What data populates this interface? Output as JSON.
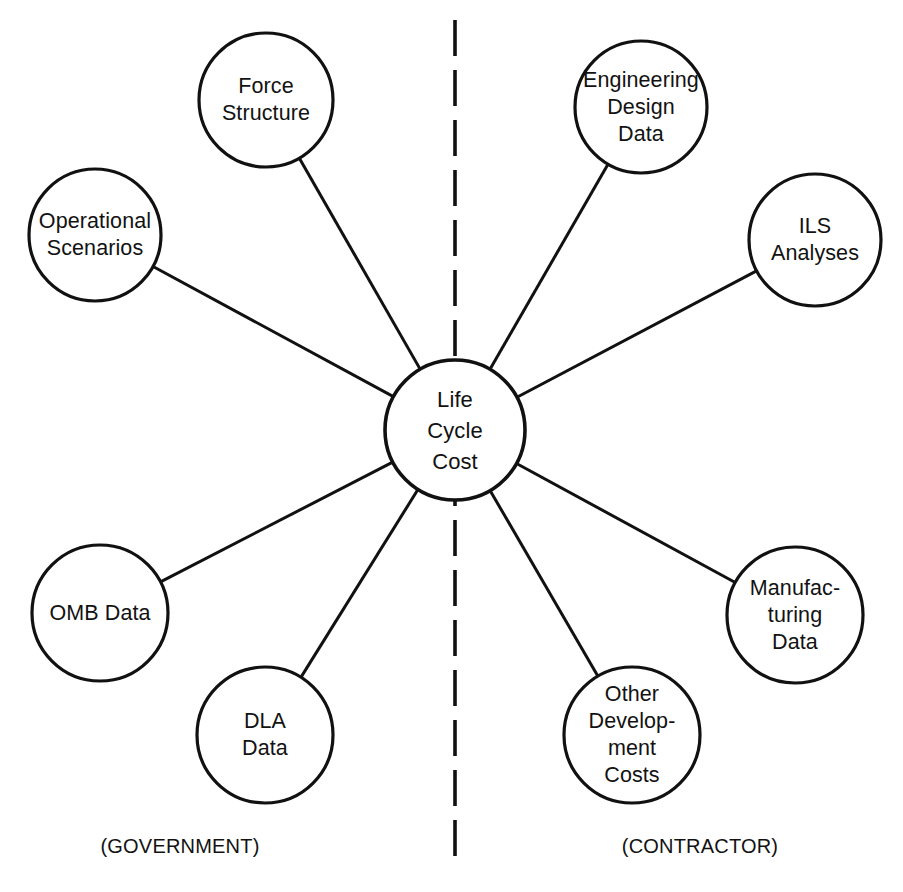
{
  "diagram": {
    "stroke_color": "#111111",
    "background_color": "#ffffff",
    "center": {
      "id": "life-cycle-cost",
      "lines": [
        "Life",
        "Cycle",
        "Cost"
      ],
      "cx": 455,
      "cy": 430,
      "r": 70
    },
    "divider": {
      "label": "dashed-vertical-divider",
      "x": 455,
      "y_start": 20,
      "y_end": 858,
      "dash": "36 14"
    },
    "captions": [
      {
        "id": "government",
        "text": "(GOVERNMENT)",
        "x": 180,
        "y": 846
      },
      {
        "id": "contractor",
        "text": "(CONTRACTOR)",
        "x": 700,
        "y": 846
      }
    ],
    "nodes": [
      {
        "id": "force-structure",
        "side": "government",
        "lines": [
          "Force",
          "Structure"
        ],
        "cx": 266,
        "cy": 100,
        "r": 67
      },
      {
        "id": "operational-scenarios",
        "side": "government",
        "lines": [
          "Operational",
          "Scenarios"
        ],
        "cx": 95,
        "cy": 235,
        "r": 66
      },
      {
        "id": "omb-data",
        "side": "government",
        "lines": [
          "OMB Data"
        ],
        "cx": 100,
        "cy": 613,
        "r": 68
      },
      {
        "id": "dla-data",
        "side": "government",
        "lines": [
          "DLA",
          "Data"
        ],
        "cx": 265,
        "cy": 735,
        "r": 68
      },
      {
        "id": "engineering-design-data",
        "side": "contractor",
        "lines": [
          "Engineering",
          "Design",
          "Data"
        ],
        "cx": 641,
        "cy": 107,
        "r": 66
      },
      {
        "id": "ils-analyses",
        "side": "contractor",
        "lines": [
          "ILS",
          "Analyses"
        ],
        "cx": 815,
        "cy": 240,
        "r": 66
      },
      {
        "id": "manufacturing-data",
        "side": "contractor",
        "lines": [
          "Manufac-",
          "turing",
          "Data"
        ],
        "cx": 795,
        "cy": 615,
        "r": 68
      },
      {
        "id": "other-development-costs",
        "side": "contractor",
        "lines": [
          "Other",
          "Develop-",
          "ment",
          "Costs"
        ],
        "cx": 632,
        "cy": 735,
        "r": 68
      }
    ],
    "edges": [
      {
        "from": "life-cycle-cost",
        "to": "force-structure"
      },
      {
        "from": "life-cycle-cost",
        "to": "operational-scenarios"
      },
      {
        "from": "life-cycle-cost",
        "to": "omb-data"
      },
      {
        "from": "life-cycle-cost",
        "to": "dla-data"
      },
      {
        "from": "life-cycle-cost",
        "to": "engineering-design-data"
      },
      {
        "from": "life-cycle-cost",
        "to": "ils-analyses"
      },
      {
        "from": "life-cycle-cost",
        "to": "manufacturing-data"
      },
      {
        "from": "life-cycle-cost",
        "to": "other-development-costs"
      }
    ]
  }
}
